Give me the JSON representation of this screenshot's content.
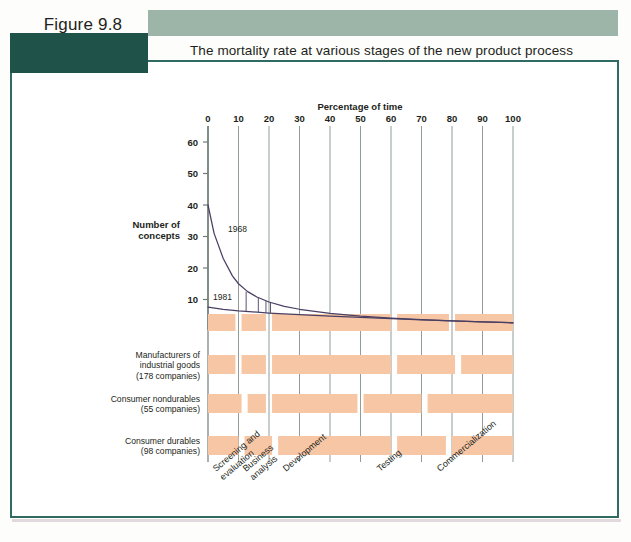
{
  "figure": {
    "label": "Figure 9.8",
    "title": "The mortality rate at various stages of the new product process"
  },
  "colors": {
    "band_light": "#9db4a8",
    "band_dark": "#1f5249",
    "frame": "#2f6a63",
    "bar_fill": "#f7c6a5",
    "gridline": "#6f7f76",
    "curve": "#4a3f63",
    "text": "#231f20"
  },
  "chart_data": {
    "type": "line",
    "title": "The mortality rate at various stages of the new product process",
    "xlabel": "Percentage of time",
    "ylabel": "Number of concepts",
    "xlim": [
      0,
      100
    ],
    "ylim": [
      0,
      65
    ],
    "grid": true,
    "legend": "inline-annotations",
    "xticks": [
      "0",
      "10",
      "20",
      "30",
      "40",
      "50",
      "60",
      "70",
      "80",
      "90",
      "100"
    ],
    "yticks": [
      "10",
      "20",
      "30",
      "40",
      "50",
      "60"
    ],
    "series": [
      {
        "name": "1968",
        "label": "1968",
        "x": [
          0,
          2,
          5,
          8,
          10,
          13,
          16,
          20,
          25,
          30,
          40,
          50,
          60,
          70,
          80,
          90,
          100
        ],
        "values": [
          40,
          31,
          23,
          17.5,
          15,
          12.5,
          10.8,
          9.2,
          7.8,
          6.9,
          5.6,
          4.7,
          4.1,
          3.6,
          3.2,
          2.9,
          2.6
        ]
      },
      {
        "name": "1981",
        "label": "1981",
        "x": [
          0,
          5,
          10,
          20,
          30,
          40,
          50,
          60,
          70,
          80,
          90,
          100
        ],
        "values": [
          7.6,
          6.9,
          6.4,
          5.7,
          5.2,
          4.7,
          4.3,
          3.9,
          3.5,
          3.2,
          2.9,
          2.6
        ]
      }
    ],
    "stages": [
      "Screening and evaluation",
      "Business analysis",
      "Development",
      "Testing",
      "Commercialization"
    ],
    "rows": [
      {
        "name": "all-industries",
        "label_lines": [],
        "segments": [
          {
            "start": 0,
            "end": 9
          },
          {
            "start": 11,
            "end": 19
          },
          {
            "start": 21,
            "end": 60
          },
          {
            "start": 62,
            "end": 79
          },
          {
            "start": 81,
            "end": 100
          }
        ]
      },
      {
        "name": "manufacturers-industrial-goods",
        "label_lines": [
          "Manufacturers of",
          "industrial goods",
          "(178 companies)"
        ],
        "segments": [
          {
            "start": 0,
            "end": 9
          },
          {
            "start": 11,
            "end": 19
          },
          {
            "start": 21,
            "end": 60
          },
          {
            "start": 62,
            "end": 81
          },
          {
            "start": 83,
            "end": 100
          }
        ]
      },
      {
        "name": "consumer-nondurables",
        "label_lines": [
          "Consumer nondurables",
          "(55 companies)"
        ],
        "segments": [
          {
            "start": 0,
            "end": 11
          },
          {
            "start": 13,
            "end": 19
          },
          {
            "start": 21,
            "end": 49
          },
          {
            "start": 51,
            "end": 70
          },
          {
            "start": 72,
            "end": 100
          }
        ]
      },
      {
        "name": "consumer-durables",
        "label_lines": [
          "Consumer durables",
          "(98 companies)"
        ],
        "segments": [
          {
            "start": 0,
            "end": 10
          },
          {
            "start": 12,
            "end": 21
          },
          {
            "start": 23,
            "end": 60
          },
          {
            "start": 62,
            "end": 78
          },
          {
            "start": 80,
            "end": 100
          }
        ]
      }
    ]
  }
}
